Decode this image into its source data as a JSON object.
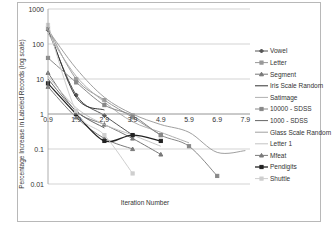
{
  "chart_data": {
    "type": "line",
    "title": "",
    "xlabel": "Iteration Number",
    "ylabel": "Percentage Increase in Labeled Records (log scale)",
    "yscale": "log",
    "ylim": [
      0.01,
      1000
    ],
    "y_ticks": [
      "1000",
      "100",
      "10",
      "1",
      "0.1",
      "0.01"
    ],
    "x_ticks": [
      "0.9",
      "1.9",
      "2.9",
      "3.9",
      "4.9",
      "5.9",
      "6.9",
      "7.9"
    ],
    "x_axis_crosses_at_y": 1,
    "grid": "horizontal",
    "legend_position": "right",
    "series": [
      {
        "name": "Vowel",
        "x": [
          0.9,
          1.9,
          2.9,
          3.9
        ],
        "values": [
          250,
          3.5,
          0.9,
          0.25
        ],
        "color": "#555555",
        "marker": "diamond",
        "smooth": true
      },
      {
        "name": "Letter",
        "x": [
          0.9,
          1.9,
          2.9,
          3.9,
          4.9
        ],
        "values": [
          280,
          10,
          2.5,
          0.8,
          0.25
        ],
        "color": "#999999",
        "marker": "square",
        "smooth": true
      },
      {
        "name": "Segment",
        "x": [
          0.9,
          1.9,
          2.9,
          3.9,
          4.9
        ],
        "values": [
          15,
          1.2,
          0.5,
          0.2,
          0.07
        ],
        "color": "#777777",
        "marker": "triangle",
        "smooth": true
      },
      {
        "name": "Iris Scale Random",
        "x": [
          0.9,
          1.9,
          2.9
        ],
        "values": [
          300,
          3,
          1.3
        ],
        "color": "#333333",
        "marker": "none",
        "smooth": true
      },
      {
        "name": "Satimage",
        "x": [
          0.9,
          1.9,
          2.9,
          3.9,
          4.9,
          5.9
        ],
        "values": [
          200,
          12,
          2.2,
          0.6,
          0.3,
          0.15
        ],
        "color": "#b0b0b0",
        "marker": "none",
        "smooth": true
      },
      {
        "name": "10000 - SDSS",
        "x": [
          0.9,
          1.9,
          2.9,
          3.9,
          4.9,
          5.9,
          6.9
        ],
        "values": [
          40,
          8,
          1.8,
          0.9,
          0.25,
          0.12,
          0.017
        ],
        "color": "#888888",
        "marker": "square",
        "smooth": true
      },
      {
        "name": "1000 - SDSS",
        "x": [
          0.9,
          1.9,
          2.9
        ],
        "values": [
          10,
          1.2,
          0.4
        ],
        "color": "#666666",
        "marker": "none",
        "smooth": true
      },
      {
        "name": "Glass Scale Random",
        "x": [
          0.9,
          1.9,
          2.9,
          3.9,
          4.9,
          5.9,
          6.9,
          7.9
        ],
        "values": [
          250,
          20,
          3,
          1,
          0.5,
          0.3,
          0.08,
          0.09
        ],
        "color": "#a0a0a0",
        "marker": "none",
        "smooth": true
      },
      {
        "name": "Letter 1",
        "x": [
          0.9,
          1.9,
          2.9,
          3.9,
          4.9
        ],
        "values": [
          12,
          1.5,
          0.5,
          0.25,
          0.12
        ],
        "color": "#c4c4c4",
        "marker": "none",
        "smooth": true
      },
      {
        "name": "Mfeat",
        "x": [
          0.9,
          1.9,
          2.9,
          3.9
        ],
        "values": [
          6,
          0.8,
          0.2,
          0.1
        ],
        "color": "#7a7a7a",
        "marker": "triangle",
        "smooth": true
      },
      {
        "name": "Pendigits",
        "x": [
          0.9,
          1.9,
          2.9,
          3.9,
          4.9
        ],
        "values": [
          7.5,
          1.0,
          0.17,
          0.25,
          0.17
        ],
        "color": "#222222",
        "marker": "square",
        "smooth": true
      },
      {
        "name": "Shuttle",
        "x": [
          0.9,
          1.9,
          2.9,
          3.9
        ],
        "values": [
          350,
          1.2,
          0.25,
          0.02
        ],
        "color": "#cfcfcf",
        "marker": "square",
        "smooth": true
      }
    ]
  },
  "legend": {
    "items": [
      "Vowel",
      "Letter",
      "Segment",
      "Iris Scale Random",
      "Satimage",
      "10000 - SDSS",
      "1000 - SDSS",
      "Glass Scale Random",
      "Letter 1",
      "Mfeat",
      "Pendigits",
      "Shuttle"
    ]
  }
}
